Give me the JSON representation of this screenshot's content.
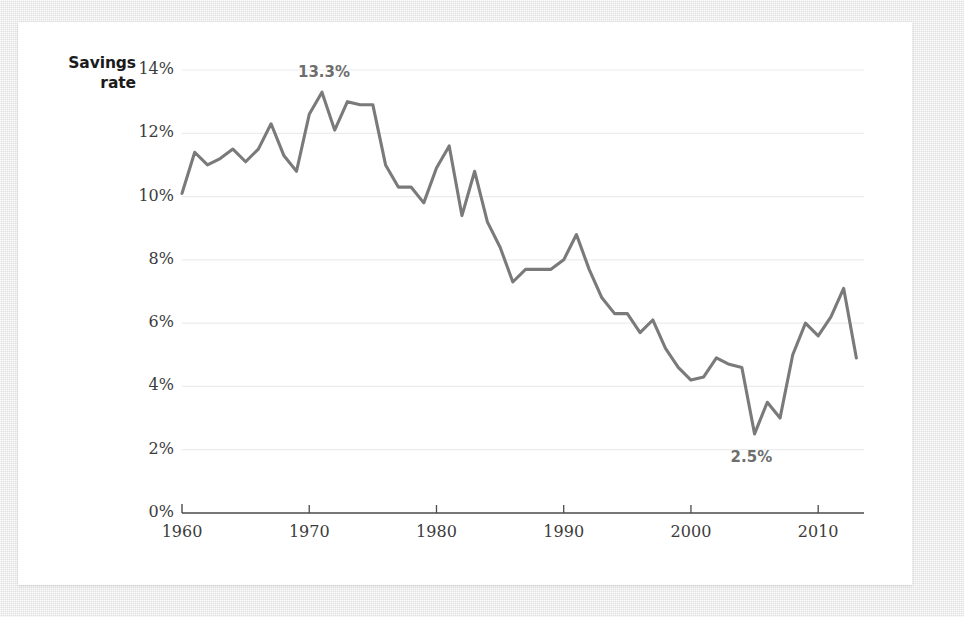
{
  "figure": {
    "y_axis_title_line1": "Savings",
    "y_axis_title_line2": "rate"
  },
  "annotations": {
    "peak_label": "13.3%",
    "trough_label": "2.5%"
  },
  "colors": {
    "line": "#7a7a7a",
    "grid": "#ececec",
    "axis": "#4a4a4a",
    "tick_text": "#3c3c3c",
    "annotation_text": "#6e6e6e",
    "title_text": "#1b1b1b",
    "card_background": "#ffffff",
    "page_background": "#e9e9e9"
  },
  "chart_data": {
    "type": "line",
    "title": "",
    "subtitle": "",
    "xlabel": "",
    "ylabel": "Savings rate",
    "xlim": [
      1960,
      2013.6
    ],
    "ylim": [
      0,
      14
    ],
    "grid": true,
    "legend": "none",
    "y_ticks": [
      0,
      2,
      4,
      6,
      8,
      10,
      12,
      14
    ],
    "y_tick_labels": [
      "0%",
      "2%",
      "4%",
      "6%",
      "8%",
      "10%",
      "12%",
      "14%"
    ],
    "x_ticks": [
      1960,
      1970,
      1980,
      1990,
      2000,
      2010
    ],
    "x_tick_labels": [
      "1960",
      "1970",
      "1980",
      "1990",
      "2000",
      "2010"
    ],
    "series": [
      {
        "name": "Savings rate",
        "color": "#7a7a7a",
        "x": [
          1960,
          1961,
          1962,
          1963,
          1964,
          1965,
          1966,
          1967,
          1968,
          1969,
          1970,
          1971,
          1972,
          1973,
          1974,
          1975,
          1976,
          1977,
          1978,
          1979,
          1980,
          1981,
          1982,
          1983,
          1984,
          1985,
          1986,
          1987,
          1988,
          1989,
          1990,
          1991,
          1992,
          1993,
          1994,
          1995,
          1996,
          1997,
          1998,
          1999,
          2000,
          2001,
          2002,
          2003,
          2004,
          2005,
          2006,
          2007,
          2008,
          2009,
          2010,
          2011,
          2012,
          2013
        ],
        "y": [
          10.1,
          11.4,
          11.0,
          11.2,
          11.5,
          11.1,
          11.5,
          12.3,
          11.3,
          10.8,
          12.6,
          13.3,
          12.1,
          13.0,
          12.9,
          12.9,
          11.0,
          10.3,
          10.3,
          9.8,
          10.9,
          11.6,
          9.4,
          10.8,
          9.2,
          8.4,
          7.3,
          7.7,
          7.7,
          7.7,
          8.0,
          8.8,
          7.7,
          6.8,
          6.3,
          6.3,
          5.7,
          6.1,
          5.2,
          4.6,
          4.2,
          4.3,
          4.9,
          4.7,
          4.6,
          2.5,
          3.5,
          3.0,
          5.0,
          6.0,
          5.6,
          6.2,
          7.1,
          4.9
        ]
      }
    ],
    "annotations": [
      {
        "label": "13.3%",
        "x": 1971,
        "y": 13.3,
        "position": "above"
      },
      {
        "label": "2.5%",
        "x": 2005,
        "y": 2.5,
        "position": "below"
      }
    ]
  }
}
